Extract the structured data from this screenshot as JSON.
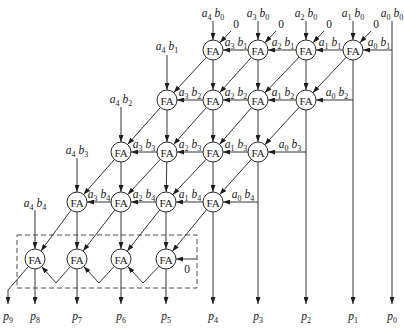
{
  "diagram": {
    "type": "array-multiplier-5x5",
    "node_label": "FA",
    "node_radius": 10,
    "colors": {
      "line": "#2a2a2a",
      "text": "#1a1a1a",
      "background": "#ffffff"
    },
    "nodes": [
      {
        "id": "1a",
        "x": 213,
        "y": 50,
        "label": "FA"
      },
      {
        "id": "1b",
        "x": 258,
        "y": 50,
        "label": "FA"
      },
      {
        "id": "1c",
        "x": 306,
        "y": 50,
        "label": "FA"
      },
      {
        "id": "1d",
        "x": 353,
        "y": 50,
        "label": "FA"
      },
      {
        "id": "2a",
        "x": 167,
        "y": 100,
        "label": "FA"
      },
      {
        "id": "2b",
        "x": 213,
        "y": 100,
        "label": "FA"
      },
      {
        "id": "2c",
        "x": 258,
        "y": 100,
        "label": "FA"
      },
      {
        "id": "2d",
        "x": 306,
        "y": 100,
        "label": "FA"
      },
      {
        "id": "3a",
        "x": 121,
        "y": 152,
        "label": "FA"
      },
      {
        "id": "3b",
        "x": 167,
        "y": 152,
        "label": "FA"
      },
      {
        "id": "3c",
        "x": 213,
        "y": 152,
        "label": "FA"
      },
      {
        "id": "3d",
        "x": 258,
        "y": 152,
        "label": "FA"
      },
      {
        "id": "4a",
        "x": 77,
        "y": 202,
        "label": "FA"
      },
      {
        "id": "4b",
        "x": 121,
        "y": 202,
        "label": "FA"
      },
      {
        "id": "4c",
        "x": 166,
        "y": 202,
        "label": "FA"
      },
      {
        "id": "4d",
        "x": 213,
        "y": 202,
        "label": "FA"
      },
      {
        "id": "5a",
        "x": 35,
        "y": 259,
        "label": "FA"
      },
      {
        "id": "5b",
        "x": 77,
        "y": 259,
        "label": "FA"
      },
      {
        "id": "5c",
        "x": 121,
        "y": 259,
        "label": "FA"
      },
      {
        "id": "5d",
        "x": 166,
        "y": 259,
        "label": "FA"
      }
    ],
    "wires": [
      {
        "name": "input-wire-a4b0",
        "from": [
          213,
          21
        ],
        "to": "1a"
      },
      {
        "name": "input-wire-a3b0",
        "from": [
          258,
          21
        ],
        "to": "1b"
      },
      {
        "name": "input-wire-a2b0",
        "from": [
          306,
          21
        ],
        "to": "1c"
      },
      {
        "name": "input-wire-a1b0",
        "from": [
          353,
          21
        ],
        "to": "1d"
      },
      {
        "name": "output-wire-p0",
        "from": [
          392,
          21
        ],
        "to": [
          392,
          304
        ]
      },
      {
        "name": "zero-input-wire",
        "from": [
          231,
          31
        ],
        "to": "1a"
      },
      {
        "name": "zero-input-wire",
        "from": [
          276,
          31
        ],
        "to": "1b"
      },
      {
        "name": "zero-input-wire",
        "from": [
          324,
          31
        ],
        "to": "1c"
      },
      {
        "name": "zero-input-wire",
        "from": [
          371,
          31
        ],
        "to": "1d"
      },
      {
        "name": "horizontal-wire-a3b1",
        "from": "1b",
        "to": "1a"
      },
      {
        "name": "horizontal-wire-a2b1",
        "from": "1c",
        "to": "1b"
      },
      {
        "name": "horizontal-wire-a1b1",
        "from": "1d",
        "to": "1c"
      },
      {
        "name": "horizontal-wire-a0b1",
        "from": [
          392,
          50
        ],
        "to": "1d"
      },
      {
        "name": "vertical-wire",
        "from": "1a",
        "to": "2b"
      },
      {
        "name": "vertical-wire",
        "from": "1b",
        "to": "2c"
      },
      {
        "name": "vertical-wire",
        "from": "1c",
        "to": "2d"
      },
      {
        "name": "output-wire-p1",
        "from": "1d",
        "to": [
          353,
          304
        ]
      },
      {
        "name": "diagonal-wire",
        "from": "1a",
        "to": "2a"
      },
      {
        "name": "diagonal-wire",
        "from": "1b",
        "to": "2b"
      },
      {
        "name": "diagonal-wire",
        "from": "1c",
        "to": "2c"
      },
      {
        "name": "diagonal-wire",
        "from": "1d",
        "to": "2d"
      },
      {
        "name": "input-wire-a4b1",
        "from": [
          167,
          55
        ],
        "to": "2a"
      },
      {
        "name": "horizontal-wire-a3b2",
        "from": "2b",
        "to": "2a"
      },
      {
        "name": "horizontal-wire-a2b2",
        "from": "2c",
        "to": "2b"
      },
      {
        "name": "horizontal-wire-a1b2",
        "from": "2d",
        "to": "2c"
      },
      {
        "name": "horizontal-wire-a0b2",
        "from": [
          353,
          100
        ],
        "to": "2d"
      },
      {
        "name": "vertical-wire",
        "from": "2a",
        "to": "3b"
      },
      {
        "name": "vertical-wire",
        "from": "2b",
        "to": "3c"
      },
      {
        "name": "vertical-wire",
        "from": "2c",
        "to": "3d"
      },
      {
        "name": "output-wire-p2",
        "from": "2d",
        "to": [
          306,
          304
        ]
      },
      {
        "name": "diagonal-wire",
        "from": "2a",
        "to": "3a"
      },
      {
        "name": "diagonal-wire",
        "from": "2b",
        "to": "3b"
      },
      {
        "name": "diagonal-wire",
        "from": "2c",
        "to": "3c"
      },
      {
        "name": "diagonal-wire",
        "from": "2d",
        "to": "3d"
      },
      {
        "name": "input-wire-a4b2",
        "from": [
          121,
          107
        ],
        "to": "3a"
      },
      {
        "name": "horizontal-wire-a3b3",
        "from": "3b",
        "to": "3a"
      },
      {
        "name": "horizontal-wire-a2b3",
        "from": "3c",
        "to": "3b"
      },
      {
        "name": "horizontal-wire-a1b3",
        "from": "3d",
        "to": "3c"
      },
      {
        "name": "horizontal-wire-a0b3",
        "from": [
          306,
          152
        ],
        "to": "3d"
      },
      {
        "name": "vertical-wire",
        "from": "3a",
        "to": "4b"
      },
      {
        "name": "vertical-wire",
        "from": "3b",
        "to": "4c"
      },
      {
        "name": "vertical-wire",
        "from": "3c",
        "to": "4d"
      },
      {
        "name": "output-wire-p3",
        "from": "3d",
        "to": [
          258,
          304
        ]
      },
      {
        "name": "diagonal-wire",
        "from": "3a",
        "to": "4a"
      },
      {
        "name": "diagonal-wire",
        "from": "3b",
        "to": "4b"
      },
      {
        "name": "diagonal-wire",
        "from": "3c",
        "to": "4c"
      },
      {
        "name": "diagonal-wire",
        "from": "3d",
        "to": "4d"
      },
      {
        "name": "input-wire-a4b3",
        "from": [
          77,
          158
        ],
        "to": "4a"
      },
      {
        "name": "horizontal-wire-a3b4",
        "from": "4b",
        "to": "4a"
      },
      {
        "name": "horizontal-wire-a2b4",
        "from": "4c",
        "to": "4b"
      },
      {
        "name": "horizontal-wire-a1b4",
        "from": "4d",
        "to": "4c"
      },
      {
        "name": "horizontal-wire-a0b4",
        "from": [
          258,
          202
        ],
        "to": "4d"
      },
      {
        "name": "vertical-wire",
        "from": "4a",
        "to": "5b"
      },
      {
        "name": "vertical-wire",
        "from": "4b",
        "to": "5c"
      },
      {
        "name": "vertical-wire",
        "from": "4c",
        "to": "5d"
      },
      {
        "name": "output-wire-p4",
        "from": "4d",
        "to": [
          213,
          304
        ]
      },
      {
        "name": "diagonal-wire",
        "from": "4a",
        "to": "5a"
      },
      {
        "name": "diagonal-wire",
        "from": "4b",
        "to": "5b"
      },
      {
        "name": "diagonal-wire",
        "from": "4c",
        "to": "5c"
      },
      {
        "name": "diagonal-wire",
        "from": "4d",
        "to": "5d"
      },
      {
        "name": "input-wire-a4b4",
        "from": [
          35,
          210
        ],
        "to": "5a"
      },
      {
        "name": "zero-input-wire",
        "from": [
          197,
          259
        ],
        "to": "5d"
      },
      {
        "name": "ripple-carry-wire",
        "from": "5d",
        "via": [
          [
            143,
            283
          ]
        ],
        "to": "5c"
      },
      {
        "name": "ripple-carry-wire",
        "from": "5c",
        "via": [
          [
            99,
            283
          ]
        ],
        "to": "5b"
      },
      {
        "name": "ripple-carry-wire",
        "from": "5b",
        "via": [
          [
            56,
            283
          ]
        ],
        "to": "5a"
      },
      {
        "name": "output-wire-p5",
        "from": "5d",
        "to": [
          166,
          304
        ]
      },
      {
        "name": "output-wire-p6",
        "from": "5c",
        "to": [
          121,
          304
        ]
      },
      {
        "name": "output-wire-p7",
        "from": "5b",
        "to": [
          77,
          304
        ]
      },
      {
        "name": "output-wire-p8",
        "from": "5a",
        "to": [
          35,
          304
        ]
      },
      {
        "name": "output-wire-p9",
        "from": "5a",
        "via": [
          [
            8,
            290
          ]
        ],
        "to": [
          8,
          304
        ]
      }
    ],
    "labels": [
      {
        "role": "input-label",
        "text": "a4 b0",
        "x": 213,
        "y": 17
      },
      {
        "role": "input-label",
        "text": "a3 b0",
        "x": 258,
        "y": 17
      },
      {
        "role": "input-label",
        "text": "a2 b0",
        "x": 306,
        "y": 17
      },
      {
        "role": "input-label",
        "text": "a1 b0",
        "x": 353,
        "y": 17
      },
      {
        "role": "input-label",
        "text": "a0 b0",
        "x": 392,
        "y": 17
      },
      {
        "role": "zero-label",
        "text": "0",
        "x": 236,
        "y": 28
      },
      {
        "role": "zero-label",
        "text": "0",
        "x": 281,
        "y": 28
      },
      {
        "role": "zero-label",
        "text": "0",
        "x": 329,
        "y": 28
      },
      {
        "role": "zero-label",
        "text": "0",
        "x": 376,
        "y": 28
      },
      {
        "role": "partial-product-label",
        "text": "a3 b1",
        "x": 236,
        "y": 46
      },
      {
        "role": "partial-product-label",
        "text": "a2 b1",
        "x": 283,
        "y": 46
      },
      {
        "role": "partial-product-label",
        "text": "a1 b1",
        "x": 330,
        "y": 46
      },
      {
        "role": "partial-product-label",
        "text": "a0 b1",
        "x": 379,
        "y": 46
      },
      {
        "role": "input-label",
        "text": "a4 b1",
        "x": 167,
        "y": 50
      },
      {
        "role": "partial-product-label",
        "text": "a3 b2",
        "x": 190,
        "y": 96
      },
      {
        "role": "partial-product-label",
        "text": "a2 b2",
        "x": 236,
        "y": 96
      },
      {
        "role": "partial-product-label",
        "text": "a1 b2",
        "x": 283,
        "y": 96
      },
      {
        "role": "partial-product-label",
        "text": "a0 b2",
        "x": 337,
        "y": 96
      },
      {
        "role": "input-label",
        "text": "a4 b2",
        "x": 121,
        "y": 103
      },
      {
        "role": "partial-product-label",
        "text": "a3 b3",
        "x": 144,
        "y": 148
      },
      {
        "role": "partial-product-label",
        "text": "a2 b3",
        "x": 190,
        "y": 148
      },
      {
        "role": "partial-product-label",
        "text": "a1 b3",
        "x": 236,
        "y": 148
      },
      {
        "role": "partial-product-label",
        "text": "a0 b3",
        "x": 290,
        "y": 148
      },
      {
        "role": "input-label",
        "text": "a4 b3",
        "x": 77,
        "y": 154
      },
      {
        "role": "partial-product-label",
        "text": "a3 b4",
        "x": 99,
        "y": 198
      },
      {
        "role": "partial-product-label",
        "text": "a2 b4",
        "x": 144,
        "y": 198
      },
      {
        "role": "partial-product-label",
        "text": "a1 b4",
        "x": 190,
        "y": 198
      },
      {
        "role": "partial-product-label",
        "text": "a0 b4",
        "x": 243,
        "y": 198
      },
      {
        "role": "input-label",
        "text": "a4 b4",
        "x": 35,
        "y": 207
      },
      {
        "role": "zero-label",
        "text": "0",
        "x": 187,
        "y": 273
      },
      {
        "role": "output-label",
        "text": "p9",
        "x": 8,
        "y": 320
      },
      {
        "role": "output-label",
        "text": "p8",
        "x": 35,
        "y": 320
      },
      {
        "role": "output-label",
        "text": "p7",
        "x": 77,
        "y": 320
      },
      {
        "role": "output-label",
        "text": "p6",
        "x": 121,
        "y": 320
      },
      {
        "role": "output-label",
        "text": "p5",
        "x": 166,
        "y": 320
      },
      {
        "role": "output-label",
        "text": "p4",
        "x": 213,
        "y": 320
      },
      {
        "role": "output-label",
        "text": "p3",
        "x": 258,
        "y": 320
      },
      {
        "role": "output-label",
        "text": "p2",
        "x": 306,
        "y": 320
      },
      {
        "role": "output-label",
        "text": "p1",
        "x": 353,
        "y": 320
      },
      {
        "role": "output-label",
        "text": "p0",
        "x": 392,
        "y": 320
      }
    ],
    "dashed_box": {
      "x": 17,
      "y": 235,
      "width": 180,
      "height": 53
    }
  }
}
